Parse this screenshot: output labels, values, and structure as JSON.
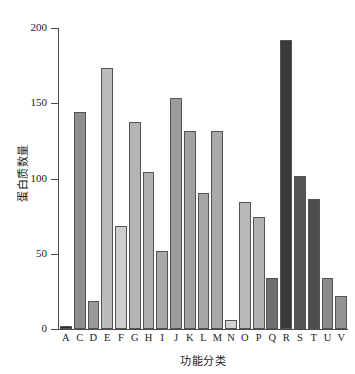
{
  "chart_data": {
    "type": "bar",
    "title": "",
    "xlabel": "功能分类",
    "ylabel": "蛋白质数量",
    "ylim": [
      0,
      200
    ],
    "yticks": [
      0,
      50,
      100,
      150,
      200
    ],
    "grid": false,
    "legend": "none",
    "categories": [
      "A",
      "C",
      "D",
      "E",
      "F",
      "G",
      "H",
      "I",
      "J",
      "K",
      "L",
      "M",
      "N",
      "O",
      "P",
      "Q",
      "R",
      "S",
      "T",
      "U",
      "V"
    ],
    "values": [
      2,
      145,
      19,
      174,
      69,
      138,
      105,
      52,
      154,
      132,
      91,
      132,
      6,
      85,
      75,
      34,
      193,
      102,
      87,
      34,
      22
    ],
    "bar_colors": [
      "#2b2b2b",
      "#8e8e8e",
      "#9a9a9a",
      "#bcbcbc",
      "#cdcdcd",
      "#b5b5b5",
      "#b0b0b0",
      "#a8a8a8",
      "#9c9c9c",
      "#a2a2a2",
      "#a6a6a6",
      "#a9a9a9",
      "#d2d2d2",
      "#b8b8b8",
      "#b2b2b2",
      "#6f6f6f",
      "#3a3a3a",
      "#555555",
      "#4e4e4e",
      "#8a8a8a",
      "#949494"
    ]
  },
  "axis": {
    "y_tick_labels": [
      "0",
      "50",
      "100",
      "150",
      "200"
    ]
  }
}
